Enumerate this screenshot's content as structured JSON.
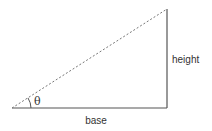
{
  "diagram": {
    "type": "right-triangle",
    "labels": {
      "base": "base",
      "height": "height",
      "angle": "θ"
    },
    "colors": {
      "line": "#555555",
      "hypotenuse": "#777777",
      "text": "#333333",
      "background": "#ffffff"
    }
  }
}
